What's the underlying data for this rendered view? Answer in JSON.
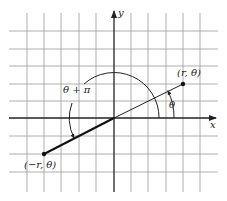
{
  "diagram": {
    "axes": {
      "x_label": "x",
      "y_label": "y"
    },
    "points": [
      {
        "id": "p1",
        "label": "(r, θ)",
        "px": [
          183,
          84
        ]
      },
      {
        "id": "p2",
        "label": "(−r, θ)",
        "px": [
          44,
          154
        ]
      }
    ],
    "angles": [
      {
        "id": "theta",
        "label": "θ"
      },
      {
        "id": "theta-plus-pi",
        "label": "θ + π"
      }
    ],
    "grid": {
      "vertical_x": [
        27,
        44,
        61,
        79,
        96,
        131,
        148,
        166,
        183,
        200
      ],
      "horizontal_y": [
        31,
        49,
        66,
        84,
        101,
        136,
        154,
        172
      ],
      "origin": [
        114,
        118
      ]
    },
    "colors": {
      "ink": "#222222",
      "grid": "#9a9a9a",
      "background": "#ffffff"
    }
  }
}
